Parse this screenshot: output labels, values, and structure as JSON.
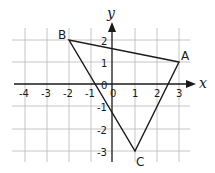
{
  "diagram": {
    "axes": {
      "x_label": "x",
      "y_label": "y",
      "x_ticks": [
        "-4",
        "-3",
        "-2",
        "-1",
        "0",
        "1",
        "2",
        "3"
      ],
      "y_ticks": [
        "2",
        "1",
        "0",
        "-1",
        "-2",
        "-3"
      ],
      "origin_label": "0"
    },
    "vertices": [
      {
        "name": "A",
        "x": 3,
        "y": 1
      },
      {
        "name": "B",
        "x": -2,
        "y": 2
      },
      {
        "name": "C",
        "x": 1,
        "y": -3
      }
    ],
    "colors": {
      "line": "#1a1a1a",
      "grid": "#b8b8b8"
    }
  }
}
